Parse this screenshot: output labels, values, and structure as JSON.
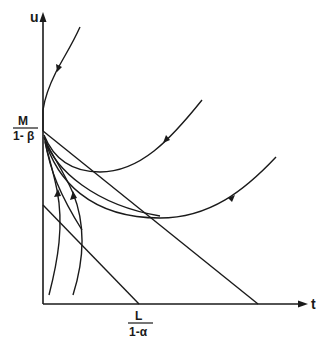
{
  "diagram": {
    "type": "phase-diagram",
    "axes": {
      "y_label": "u",
      "x_label": "t"
    },
    "intercepts": {
      "y_intercept": {
        "numerator": "M",
        "denominator": "1- β"
      },
      "x_intercept": {
        "numerator": "L",
        "denominator": "1-α"
      }
    },
    "colors": {
      "ink": "#1a1a1a",
      "background": "#ffffff"
    },
    "elements": [
      {
        "name": "long-diagonal-line",
        "description": "straight line from M/(1-β) on u-axis down to t-axis beyond L/(1-α)"
      },
      {
        "name": "short-diagonal-line",
        "description": "straight line from lower point on u-axis to L/(1-α) on t-axis"
      },
      {
        "name": "top-trajectory",
        "description": "curve descending toward M/(1-β) from upper right, arrow pointing down"
      },
      {
        "name": "upper-u-trajectory",
        "description": "U-shaped curve from M/(1-β) with arrow pointing inward"
      },
      {
        "name": "lower-u-trajectory",
        "description": "wider U-shaped curve from M/(1-β) with arrow pointing inward"
      },
      {
        "name": "bottom-trajectories",
        "description": "two curves rising from near t-axis to M/(1-β), arrows pointing up"
      },
      {
        "name": "converging-curves",
        "description": "family of curves converging to M/(1-β)"
      }
    ]
  }
}
